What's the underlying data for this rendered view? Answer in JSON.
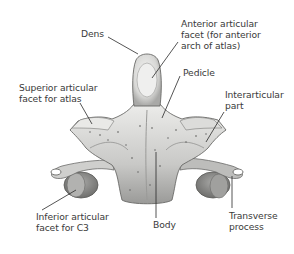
{
  "figure": {
    "colors": {
      "background": "#ffffff",
      "bone_light": "#e4e4e2",
      "bone_mid": "#b8b8b6",
      "bone_dark": "#7a7a78",
      "leader_line": "#2a2a2a",
      "text": "#3a3a3a"
    },
    "labels": {
      "dens": {
        "lines": [
          "Dens"
        ]
      },
      "anterior_facet": {
        "lines": [
          "Anterior articular",
          "facet (for anterior",
          "arch of atlas)"
        ]
      },
      "pedicle": {
        "lines": [
          "Pedicle"
        ]
      },
      "superior_facet": {
        "lines": [
          "Superior articular",
          "facet for atlas"
        ]
      },
      "interarticular": {
        "lines": [
          "Interarticular",
          "part"
        ]
      },
      "inferior_facet": {
        "lines": [
          "Inferior articular",
          "facet for C3"
        ]
      },
      "body": {
        "lines": [
          "Body"
        ]
      },
      "transverse": {
        "lines": [
          "Transverse",
          "process"
        ]
      }
    }
  }
}
